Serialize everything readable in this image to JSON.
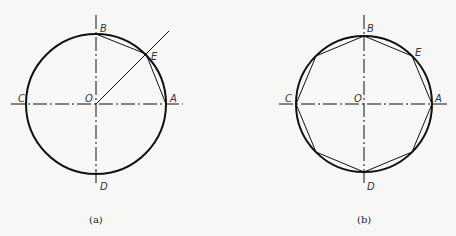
{
  "figures": [
    {
      "caption": "(a)",
      "labels": {
        "A": "A",
        "B": "B",
        "C": "C",
        "D": "D",
        "E": "E",
        "O": "O"
      }
    },
    {
      "caption": "(b)",
      "labels": {
        "A": "A",
        "B": "B",
        "C": "C",
        "D": "D",
        "E": "E",
        "O": "O"
      }
    }
  ],
  "colors": {
    "stroke": "#111111",
    "background": "#f7f7f5"
  }
}
